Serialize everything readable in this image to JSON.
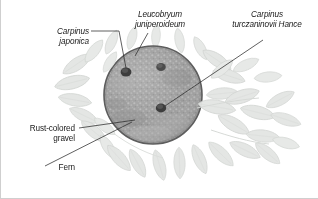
{
  "figure": {
    "kind": "botanical-illustration",
    "background_color": "#ffffff",
    "border_color": "#cfcfcf"
  },
  "labels": [
    {
      "id": "carpinus-japonica",
      "text": "Carpinus\njaponica",
      "style": "scientific-italic",
      "align": "right",
      "color": "#1a1a1a"
    },
    {
      "id": "leucobryum-juniperoideum",
      "text": "Leucobryum\njuniperoideum",
      "style": "scientific-italic",
      "align": "center",
      "color": "#1a1a1a"
    },
    {
      "id": "carpinus-turczaninovii-hance",
      "text": "Carpinus\nturczaninovii Hance",
      "style": "scientific-italic",
      "align": "center",
      "color": "#1a1a1a"
    },
    {
      "id": "rust-colored-gravel",
      "text": "Rust-colored\ngravel",
      "style": "common-upright",
      "align": "right",
      "color": "#1a1a1a"
    },
    {
      "id": "fern",
      "text": "Fern",
      "style": "common-upright",
      "align": "right",
      "color": "#1a1a1a"
    }
  ],
  "mossball": {
    "name": "moss-ball",
    "center_x": 152,
    "center_y": 95,
    "radius": 49,
    "fill_color": "#9c9c9c",
    "edge_color": "#5a5a5a",
    "texture": "speckled-moss"
  },
  "planting_points": [
    {
      "id": "point-carpinus-japonica",
      "cx": 125,
      "cy": 72,
      "r": 5.2,
      "color": "#3d3d3d"
    },
    {
      "id": "point-leucobryum",
      "cx": 160,
      "cy": 67,
      "r": 4.6,
      "color": "#4a4a4a"
    },
    {
      "id": "point-carpinus-turczaninovii",
      "cx": 160,
      "cy": 108,
      "r": 5.0,
      "color": "#3d3d3d"
    }
  ],
  "foliage": {
    "name": "surrounding-foliage",
    "fill_color": "#e4e6e4",
    "edge_color": "#d2d5d2"
  },
  "leaders": {
    "color": "#2b2b2b",
    "width": 0.7
  }
}
